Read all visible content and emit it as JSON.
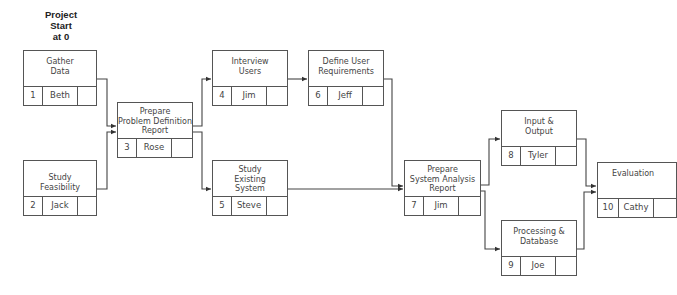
{
  "start_label": "Project\nStart\nat 0",
  "nodes": [
    {
      "id": "1",
      "title": "Gather\nData",
      "owner": "Beth",
      "duration": ""
    },
    {
      "id": "2",
      "title": "Study\nFeasibility",
      "owner": "Jack",
      "duration": ""
    },
    {
      "id": "3",
      "title": "Prepare\nProblem Definition\nReport",
      "owner": "Rose",
      "duration": ""
    },
    {
      "id": "4",
      "title": "Interview\nUsers",
      "owner": "Jim",
      "duration": ""
    },
    {
      "id": "5",
      "title": "Study\nExisting\nSystem",
      "owner": "Steve",
      "duration": ""
    },
    {
      "id": "6",
      "title": "Define User\nRequirements",
      "owner": "Jeff",
      "duration": ""
    },
    {
      "id": "7",
      "title": "Prepare\nSystem Analysis\nReport",
      "owner": "Jim",
      "duration": ""
    },
    {
      "id": "8",
      "title": "Input &\nOutput",
      "owner": "Tyler",
      "duration": ""
    },
    {
      "id": "9",
      "title": "Processing &\nDatabase",
      "owner": "Joe",
      "duration": ""
    },
    {
      "id": "10",
      "title": "Evaluation",
      "owner": "Cathy",
      "duration": ""
    }
  ],
  "edges": [
    [
      "1",
      "3"
    ],
    [
      "2",
      "3"
    ],
    [
      "3",
      "4"
    ],
    [
      "3",
      "5"
    ],
    [
      "4",
      "6"
    ],
    [
      "6",
      "7"
    ],
    [
      "5",
      "7"
    ],
    [
      "7",
      "8"
    ],
    [
      "7",
      "9"
    ],
    [
      "8",
      "10"
    ],
    [
      "9",
      "10"
    ]
  ]
}
